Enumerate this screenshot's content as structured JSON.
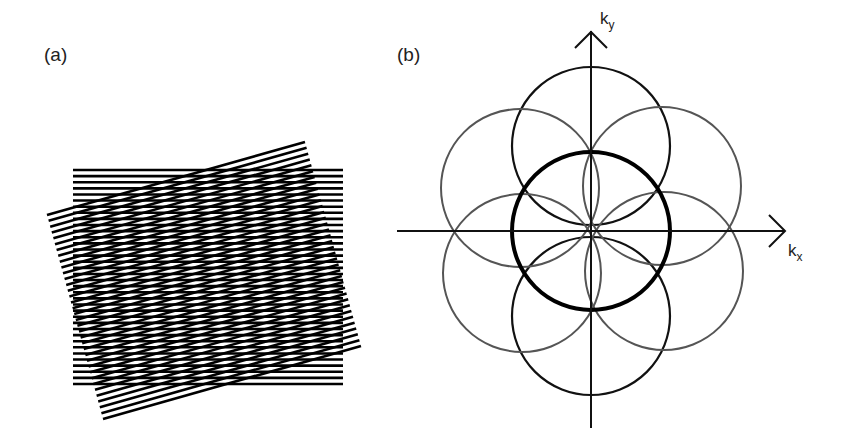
{
  "panels": [
    {
      "label": "(a)",
      "description": "Two superimposed line gratings, one horizontal and one rotated, producing a moiré pattern",
      "horizontal_grating": {
        "x0": 73,
        "x1": 343,
        "y0": 170,
        "y1": 384,
        "line_count": 36
      },
      "rotated_grating": {
        "corners": [
          [
            47,
            215
          ],
          [
            305,
            142
          ],
          [
            361,
            346
          ],
          [
            103,
            419
          ]
        ],
        "line_count": 36
      }
    },
    {
      "label": "(b)",
      "description": "Reciprocal-space diagram: central circle with six surrounding circles",
      "axes": {
        "x_label": "k",
        "x_sub": "x",
        "y_label": "k",
        "y_sub": "y",
        "origin": [
          591,
          231
        ]
      },
      "central_circle": {
        "cx": 591,
        "cy": 231,
        "r": 79
      },
      "outer_circles": [
        {
          "cx": 591,
          "cy": 146,
          "r": 79,
          "shade": "dark"
        },
        {
          "cx": 591,
          "cy": 316,
          "r": 79,
          "shade": "dark"
        },
        {
          "cx": 520,
          "cy": 188,
          "r": 79,
          "shade": "gray"
        },
        {
          "cx": 662,
          "cy": 186,
          "r": 79,
          "shade": "gray"
        },
        {
          "cx": 522,
          "cy": 273,
          "r": 79,
          "shade": "gray"
        },
        {
          "cx": 664,
          "cy": 271,
          "r": 79,
          "shade": "gray"
        }
      ]
    }
  ],
  "colors": {
    "dark": "#111111",
    "gray": "#555555",
    "background": "#ffffff"
  }
}
